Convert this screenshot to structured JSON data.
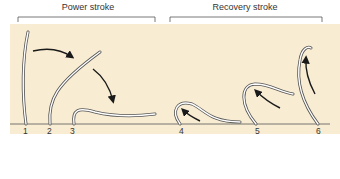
{
  "diagram": {
    "groups": [
      {
        "label": "Power stroke",
        "positions": [
          "1",
          "2",
          "3"
        ]
      },
      {
        "label": "Recovery stroke",
        "positions": [
          "4",
          "5",
          "6"
        ]
      }
    ],
    "position_labels": [
      "1",
      "2",
      "3",
      "4",
      "5",
      "6"
    ],
    "colors": {
      "background_panel": "#f8ecd2",
      "cilium_outline": "#555555",
      "cilium_fill": "#ffffff",
      "arrow": "#1a1a1a",
      "baseline": "#555555"
    }
  }
}
